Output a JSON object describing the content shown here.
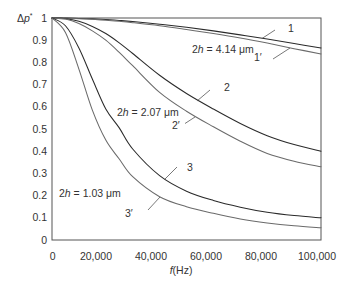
{
  "chart_data": {
    "type": "line",
    "title": "",
    "xlabel": "f(Hz)",
    "xlabel_parts": {
      "var": "f",
      "unit": "(Hz)"
    },
    "ylabel": "Δp*",
    "ylabel_parts": {
      "delta": "Δ",
      "var": "p",
      "sup": "*"
    },
    "xlim": [
      0,
      100000
    ],
    "ylim": [
      0,
      1
    ],
    "grid": false,
    "legend": "none (curves labelled inline)",
    "x_ticks": [
      {
        "value": 0,
        "label": "0"
      },
      {
        "value": 20000,
        "label": "20,000"
      },
      {
        "value": 40000,
        "label": "40,000"
      },
      {
        "value": 60000,
        "label": "60,000"
      },
      {
        "value": 80000,
        "label": "80,000"
      },
      {
        "value": 100000,
        "label": "100,000"
      }
    ],
    "y_ticks": [
      {
        "value": 1.0,
        "label": "1"
      },
      {
        "value": 0.9,
        "label": "0.9"
      },
      {
        "value": 0.8,
        "label": "0.8"
      },
      {
        "value": 0.7,
        "label": "0.7"
      },
      {
        "value": 0.6,
        "label": "0.6"
      },
      {
        "value": 0.5,
        "label": "0.5"
      },
      {
        "value": 0.4,
        "label": "0.4"
      },
      {
        "value": 0.3,
        "label": "0.3"
      },
      {
        "value": 0.2,
        "label": "0.2"
      },
      {
        "value": 0.1,
        "label": "0.1"
      },
      {
        "value": 0.0,
        "label": "0"
      }
    ],
    "x": [
      0,
      5000,
      10000,
      15000,
      20000,
      25000,
      30000,
      40000,
      50000,
      60000,
      70000,
      80000,
      90000,
      100000
    ],
    "series": [
      {
        "name": "1",
        "thickness": "2h = 4.14 μm",
        "color": "#2a2a2a",
        "values": [
          1.0,
          1.0,
          0.998,
          0.996,
          0.993,
          0.989,
          0.984,
          0.972,
          0.958,
          0.942,
          0.924,
          0.905,
          0.885,
          0.865
        ]
      },
      {
        "name": "1′",
        "thickness": "2h = 4.14 μm",
        "color": "#6a6a6a",
        "values": [
          1.0,
          0.999,
          0.997,
          0.994,
          0.99,
          0.985,
          0.979,
          0.965,
          0.948,
          0.93,
          0.91,
          0.887,
          0.862,
          0.838
        ]
      },
      {
        "name": "2",
        "thickness": "2h = 2.07 μm",
        "color": "#2a2a2a",
        "values": [
          1.0,
          0.997,
          0.985,
          0.962,
          0.93,
          0.888,
          0.84,
          0.742,
          0.66,
          0.59,
          0.525,
          0.47,
          0.43,
          0.4
        ]
      },
      {
        "name": "2′",
        "thickness": "2h = 2.07 μm",
        "color": "#6a6a6a",
        "values": [
          1.0,
          0.995,
          0.975,
          0.942,
          0.9,
          0.845,
          0.785,
          0.665,
          0.58,
          0.51,
          0.445,
          0.39,
          0.355,
          0.33
        ]
      },
      {
        "name": "3",
        "thickness": "2h = 1.03 μm",
        "color": "#2a2a2a",
        "values": [
          1.0,
          0.965,
          0.865,
          0.725,
          0.59,
          0.505,
          0.41,
          0.29,
          0.22,
          0.178,
          0.148,
          0.125,
          0.11,
          0.1
        ]
      },
      {
        "name": "3′",
        "thickness": "2h = 1.03 μm",
        "color": "#6a6a6a",
        "values": [
          1.0,
          0.935,
          0.77,
          0.585,
          0.45,
          0.365,
          0.285,
          0.195,
          0.15,
          0.12,
          0.095,
          0.077,
          0.064,
          0.055
        ]
      }
    ],
    "annotations": [
      {
        "text": "2h = 4.14 μm",
        "coef": "2",
        "var": "h",
        "rest": " = 4.14 μm",
        "applies_to": [
          "1",
          "1′"
        ]
      },
      {
        "text": "2h = 2.07 μm",
        "coef": "2",
        "var": "h",
        "rest": " = 2.07 μm",
        "applies_to": [
          "2",
          "2′"
        ]
      },
      {
        "text": "2h = 1.03 μm",
        "coef": "2",
        "var": "h",
        "rest": " = 1.03 μm",
        "applies_to": [
          "3",
          "3′"
        ]
      }
    ]
  }
}
